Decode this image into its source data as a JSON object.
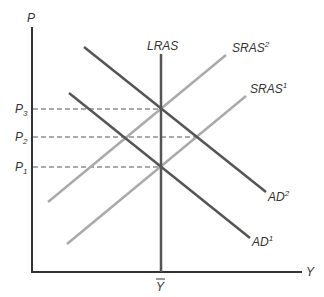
{
  "diagram": {
    "axes": {
      "y_label": "P",
      "x_label": "Y"
    },
    "price_levels": [
      {
        "name": "P",
        "sub": "3"
      },
      {
        "name": "P",
        "sub": "2"
      },
      {
        "name": "P",
        "sub": "1"
      }
    ],
    "output_level": "Y",
    "curves": {
      "lras": {
        "label": "LRAS",
        "color": "#555555"
      },
      "sras2": {
        "label": "SRAS",
        "sup": "2",
        "color": "#aaaaaa"
      },
      "sras1": {
        "label": "SRAS",
        "sup": "1",
        "color": "#aaaaaa"
      },
      "ad2": {
        "label": "AD",
        "sup": "2",
        "color": "#555555"
      },
      "ad1": {
        "label": "AD",
        "sup": "1",
        "color": "#555555"
      }
    },
    "colors": {
      "axis": "#333333",
      "dashed": "#555555"
    }
  }
}
